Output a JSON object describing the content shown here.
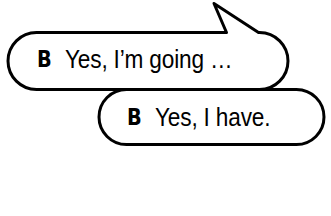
{
  "canvas": {
    "width": 331,
    "height": 216,
    "background_color": "#ffffff",
    "ink_color": "#000000",
    "stroke_width": 3
  },
  "scene": {
    "kind": "speech-bubble-illustration",
    "bubble_count": 2
  },
  "bubbles": [
    {
      "id": "bubble-one",
      "speaker": "B",
      "utterance": "Yes, I’m going …",
      "has_tail": true,
      "tail_direction": "up-left",
      "shape": "pill",
      "fill_color": "#ffffff",
      "outline_color": "#000000",
      "geometry": {
        "x": 5,
        "y": 31,
        "width": 285,
        "height": 59
      },
      "tail_geometry": {
        "apex_x": 213,
        "apex_y": 2,
        "base_left_x": 227,
        "base_right_x": 259,
        "base_y": 33
      }
    },
    {
      "id": "bubble-two",
      "speaker": "B",
      "utterance": "Yes, I have.",
      "has_tail": false,
      "tail_direction": "",
      "shape": "pill",
      "fill_color": "#ffffff",
      "outline_color": "#000000",
      "geometry": {
        "x": 97,
        "y": 88,
        "width": 229,
        "height": 58
      }
    }
  ]
}
